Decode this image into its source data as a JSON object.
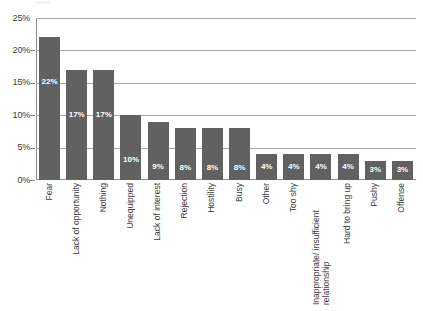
{
  "chart_data": {
    "type": "bar",
    "title": "",
    "subtitle": "",
    "xlabel": "",
    "ylabel": "",
    "orientation": "vertical",
    "grid": true,
    "legend": false,
    "legend_position": "none",
    "ylim": [
      0,
      25
    ],
    "ytick_labels": [
      "0%",
      "5%",
      "10%",
      "15%",
      "20%",
      "25%"
    ],
    "ytick_values": [
      0,
      5,
      10,
      15,
      20,
      25
    ],
    "value_label_suffix": "%",
    "bar_color": "#616161",
    "gridline_color": "#a9a9a9",
    "axis_color": "#8d8d8d",
    "value_label_color": "#ffffff",
    "categories": [
      "Fear",
      "Lack of opportunity",
      "Nothing",
      "Unequipped",
      "Lack of interest",
      "Rejection",
      "Hostility",
      "Busy",
      "Other",
      "Too shy",
      "Inappropriate/ insufficient relationship",
      "Hard to bring up",
      "Pushy",
      "Offense"
    ],
    "values": [
      22,
      17,
      17,
      10,
      9,
      8,
      8,
      8,
      4,
      4,
      4,
      4,
      3,
      3
    ],
    "data_labels": [
      "22%",
      "17%",
      "17%",
      "10%",
      "9%",
      "8%",
      "8%",
      "8%",
      "4%",
      "4%",
      "4%",
      "4%",
      "3%",
      "3%"
    ]
  }
}
